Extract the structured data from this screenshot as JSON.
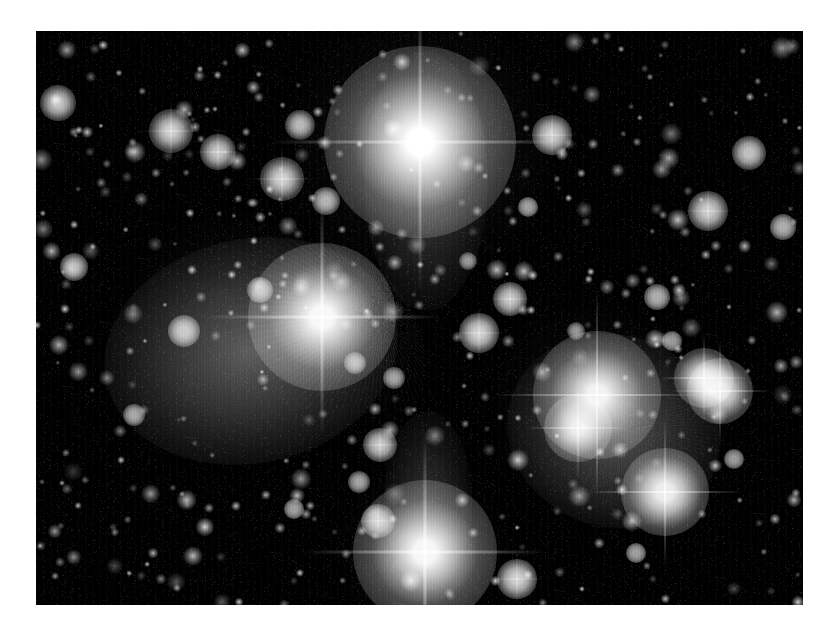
{
  "image": {
    "kind": "astronomical-photograph",
    "subject": "Pleiades open star cluster (M45) with reflection nebulosity",
    "palette": "grayscale",
    "background_color": "#ffffff",
    "plate_color": "#000000",
    "star_color": "#ffffff",
    "nebula_color": "#b9b9b9",
    "plate": {
      "x": 36,
      "y": 31,
      "width": 767,
      "height": 574
    },
    "artifacts": [
      "vertical-scan-striping",
      "diffraction-spikes",
      "halation-halos"
    ]
  },
  "chart_data": {
    "type": "scatter",
    "title": "",
    "xlabel": "",
    "ylabel": "",
    "xlim": [
      0,
      767
    ],
    "ylim": [
      0,
      574
    ],
    "grid": false,
    "legend": "none",
    "note": "Positions in plate-local pixels; r = visual core radius px; glow = halo radius px; b = relative brightness 0-1; spike = diffraction spike half-length px (0 = none)",
    "series": [
      {
        "name": "bright-stars",
        "points": [
          {
            "id": "star-alcyone-top",
            "x": 384,
            "y": 111,
            "r": 21,
            "glow": 96,
            "b": 1.0,
            "spike": 150
          },
          {
            "id": "star-merope-left",
            "x": 286,
            "y": 286,
            "r": 17,
            "glow": 74,
            "b": 0.97,
            "spike": 118
          },
          {
            "id": "star-bottom",
            "x": 389,
            "y": 521,
            "r": 17,
            "glow": 72,
            "b": 0.97,
            "spike": 120
          },
          {
            "id": "star-right-main",
            "x": 561,
            "y": 364,
            "r": 15,
            "glow": 64,
            "b": 0.94,
            "spike": 104
          },
          {
            "id": "star-right-companion",
            "x": 542,
            "y": 397,
            "r": 10,
            "glow": 34,
            "b": 0.86,
            "spike": 52
          },
          {
            "id": "star-lower-right",
            "x": 629,
            "y": 461,
            "r": 13,
            "glow": 44,
            "b": 0.92,
            "spike": 76
          },
          {
            "id": "star-pair-upper",
            "x": 668,
            "y": 347,
            "r": 10,
            "glow": 30,
            "b": 0.87,
            "spike": 44
          },
          {
            "id": "star-pair-lower",
            "x": 684,
            "y": 360,
            "r": 11,
            "glow": 33,
            "b": 0.89,
            "spike": 50
          }
        ]
      },
      {
        "name": "medium-stars",
        "points": [
          {
            "id": "m01",
            "x": 135,
            "y": 100,
            "r": 8,
            "glow": 22,
            "b": 0.8,
            "spike": 30
          },
          {
            "id": "m02",
            "x": 182,
            "y": 121,
            "r": 7,
            "glow": 18,
            "b": 0.76,
            "spike": 24
          },
          {
            "id": "m03",
            "x": 246,
            "y": 148,
            "r": 8,
            "glow": 22,
            "b": 0.8,
            "spike": 32
          },
          {
            "id": "m04",
            "x": 264,
            "y": 94,
            "r": 6,
            "glow": 15,
            "b": 0.72,
            "spike": 0
          },
          {
            "id": "m05",
            "x": 290,
            "y": 170,
            "r": 6,
            "glow": 14,
            "b": 0.7,
            "spike": 0
          },
          {
            "id": "m06",
            "x": 22,
            "y": 72,
            "r": 7,
            "glow": 18,
            "b": 0.76,
            "spike": 0
          },
          {
            "id": "m07",
            "x": 516,
            "y": 104,
            "r": 8,
            "glow": 20,
            "b": 0.78,
            "spike": 26
          },
          {
            "id": "m08",
            "x": 672,
            "y": 180,
            "r": 8,
            "glow": 20,
            "b": 0.78,
            "spike": 24
          },
          {
            "id": "m09",
            "x": 713,
            "y": 122,
            "r": 7,
            "glow": 17,
            "b": 0.75,
            "spike": 0
          },
          {
            "id": "m10",
            "x": 474,
            "y": 268,
            "r": 7,
            "glow": 17,
            "b": 0.76,
            "spike": 20
          },
          {
            "id": "m11",
            "x": 443,
            "y": 302,
            "r": 8,
            "glow": 20,
            "b": 0.8,
            "spike": 26
          },
          {
            "id": "m12",
            "x": 344,
            "y": 414,
            "r": 7,
            "glow": 17,
            "b": 0.76,
            "spike": 20
          },
          {
            "id": "m13",
            "x": 342,
            "y": 490,
            "r": 7,
            "glow": 17,
            "b": 0.76,
            "spike": 22
          },
          {
            "id": "m14",
            "x": 481,
            "y": 548,
            "r": 8,
            "glow": 20,
            "b": 0.8,
            "spike": 26
          },
          {
            "id": "m15",
            "x": 148,
            "y": 300,
            "r": 7,
            "glow": 16,
            "b": 0.74,
            "spike": 0
          },
          {
            "id": "m16",
            "x": 38,
            "y": 236,
            "r": 6,
            "glow": 14,
            "b": 0.7,
            "spike": 0
          },
          {
            "id": "m17",
            "x": 224,
            "y": 259,
            "r": 6,
            "glow": 13,
            "b": 0.68,
            "spike": 0
          },
          {
            "id": "m18",
            "x": 323,
            "y": 451,
            "r": 5,
            "glow": 11,
            "b": 0.64,
            "spike": 0
          },
          {
            "id": "m19",
            "x": 621,
            "y": 266,
            "r": 6,
            "glow": 13,
            "b": 0.68,
            "spike": 0
          },
          {
            "id": "m20",
            "x": 747,
            "y": 196,
            "r": 6,
            "glow": 13,
            "b": 0.68,
            "spike": 0
          },
          {
            "id": "m21",
            "x": 319,
            "y": 332,
            "r": 5,
            "glow": 11,
            "b": 0.64,
            "spike": 0
          },
          {
            "id": "m22",
            "x": 358,
            "y": 347,
            "r": 5,
            "glow": 11,
            "b": 0.64,
            "spike": 0
          },
          {
            "id": "m23",
            "x": 492,
            "y": 176,
            "r": 5,
            "glow": 10,
            "b": 0.62,
            "spike": 0
          },
          {
            "id": "m24",
            "x": 258,
            "y": 478,
            "r": 5,
            "glow": 10,
            "b": 0.62,
            "spike": 0
          },
          {
            "id": "m25",
            "x": 98,
            "y": 384,
            "r": 5,
            "glow": 11,
            "b": 0.64,
            "spike": 0
          },
          {
            "id": "m26",
            "x": 600,
            "y": 522,
            "r": 5,
            "glow": 10,
            "b": 0.62,
            "spike": 0
          },
          {
            "id": "m27",
            "x": 432,
            "y": 230,
            "r": 4,
            "glow": 9,
            "b": 0.58,
            "spike": 0
          },
          {
            "id": "m28",
            "x": 540,
            "y": 300,
            "r": 4,
            "glow": 9,
            "b": 0.58,
            "spike": 0
          },
          {
            "id": "m29",
            "x": 636,
            "y": 310,
            "r": 5,
            "glow": 10,
            "b": 0.6,
            "spike": 0
          },
          {
            "id": "m30",
            "x": 698,
            "y": 428,
            "r": 5,
            "glow": 10,
            "b": 0.6,
            "spike": 0
          }
        ]
      },
      {
        "name": "faint-stars-count",
        "points": [],
        "approximate_count": 420
      }
    ],
    "nebulae": [
      {
        "id": "nebula-merope-left",
        "cx": 215,
        "cy": 320,
        "rx": 148,
        "ry": 112,
        "rot": -12,
        "peak": 0.34
      },
      {
        "id": "nebula-right-lobe",
        "cx": 578,
        "cy": 400,
        "rx": 108,
        "ry": 96,
        "rot": 18,
        "peak": 0.3
      },
      {
        "id": "nebula-top-plume",
        "cx": 390,
        "cy": 150,
        "rx": 62,
        "ry": 130,
        "rot": 0,
        "peak": 0.22
      },
      {
        "id": "nebula-bottom-plume",
        "cx": 392,
        "cy": 470,
        "rx": 44,
        "ry": 90,
        "rot": 0,
        "peak": 0.18
      }
    ]
  }
}
